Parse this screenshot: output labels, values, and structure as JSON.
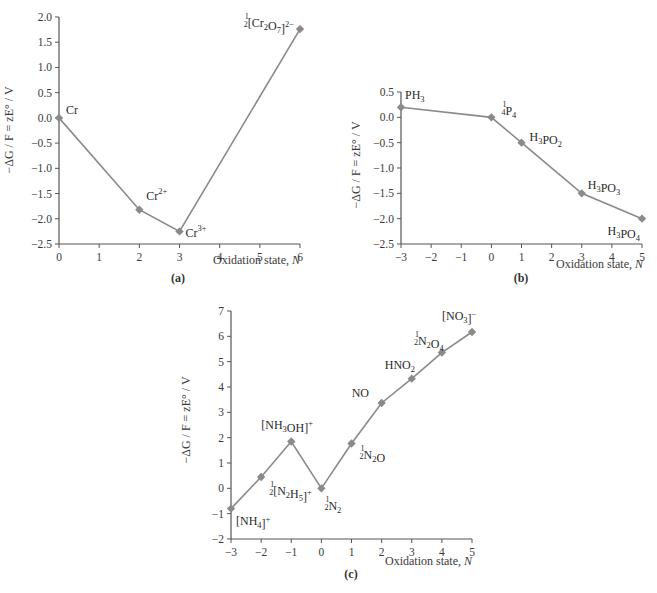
{
  "chart_data": [
    {
      "id": "a",
      "type": "line",
      "caption": "(a)",
      "xlabel": "Oxidation state, N",
      "ylabel": "−ΔG / F = zE° / V",
      "xlim": [
        0,
        6
      ],
      "ylim": [
        -2.5,
        2.0
      ],
      "xticks": [
        "0",
        "1",
        "2",
        "3",
        "4",
        "5",
        "6"
      ],
      "yticks": [
        "2.0",
        "1.5",
        "1.0",
        "0.5",
        "0.0",
        "−0.5",
        "−1.0",
        "−1.5",
        "−2.0",
        "−2.5"
      ],
      "grid": false,
      "marker": "diamond",
      "color": "#8a8a8a",
      "points": [
        {
          "x": 0,
          "y": 0.0,
          "label": "Cr"
        },
        {
          "x": 2,
          "y": -1.82,
          "label": "Cr2+"
        },
        {
          "x": 3,
          "y": -2.25,
          "label": "Cr3+"
        },
        {
          "x": 6,
          "y": 1.76,
          "label": "1/2 [Cr2O7]2−"
        }
      ]
    },
    {
      "id": "b",
      "type": "line",
      "caption": "(b)",
      "xlabel": "Oxidation state, N",
      "ylabel": "−ΔG / F = zE° / V",
      "xlim": [
        -3,
        5
      ],
      "ylim": [
        -2.5,
        0.5
      ],
      "xticks": [
        "−3",
        "−2",
        "−1",
        "0",
        "1",
        "2",
        "3",
        "4",
        "5"
      ],
      "yticks": [
        "0.5",
        "0.0",
        "−0.5",
        "−1.0",
        "−1.5",
        "−2.0",
        "−2.5"
      ],
      "grid": false,
      "marker": "diamond",
      "color": "#8a8a8a",
      "points": [
        {
          "x": -3,
          "y": 0.2,
          "label": "PH3"
        },
        {
          "x": 0,
          "y": 0.0,
          "label": "1/4 P4"
        },
        {
          "x": 1,
          "y": -0.5,
          "label": "H3PO2"
        },
        {
          "x": 3,
          "y": -1.5,
          "label": "H3PO3"
        },
        {
          "x": 5,
          "y": -2.0,
          "label": "H3PO4"
        }
      ]
    },
    {
      "id": "c",
      "type": "line",
      "caption": "(c)",
      "xlabel": "Oxidation state, N",
      "ylabel": "−ΔG / F = zE° / V",
      "xlim": [
        -3,
        5
      ],
      "ylim": [
        -2,
        7
      ],
      "xticks": [
        "−3",
        "−2",
        "−1",
        "0",
        "1",
        "2",
        "3",
        "4",
        "5"
      ],
      "yticks": [
        "7",
        "6",
        "5",
        "4",
        "3",
        "2",
        "1",
        "0",
        "−1",
        "−2"
      ],
      "grid": false,
      "marker": "diamond",
      "color": "#8a8a8a",
      "points": [
        {
          "x": -3,
          "y": -0.8,
          "label": "[NH4]+"
        },
        {
          "x": -2,
          "y": 0.45,
          "label": "1/2 [N2H5]+"
        },
        {
          "x": -1,
          "y": 1.85,
          "label": "[NH3OH]+"
        },
        {
          "x": 0,
          "y": 0.0,
          "label": "1/2 N2"
        },
        {
          "x": 1,
          "y": 1.77,
          "label": "1/2 N2O"
        },
        {
          "x": 2,
          "y": 3.37,
          "label": "NO"
        },
        {
          "x": 3,
          "y": 4.33,
          "label": "HNO2"
        },
        {
          "x": 4,
          "y": 5.36,
          "label": "1/2 N2O4"
        },
        {
          "x": 5,
          "y": 6.17,
          "label": "[NO3]−"
        }
      ]
    }
  ],
  "labels": {
    "xlabel_text": "Oxidation state, ",
    "xlabel_var": "N",
    "cap_a": "(a)",
    "cap_b": "(b)",
    "cap_c": "(c)"
  }
}
